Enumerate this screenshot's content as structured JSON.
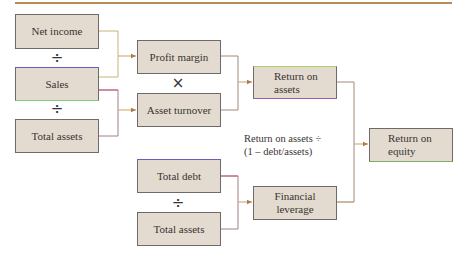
{
  "diagram": {
    "title": "",
    "boxes": {
      "net_income": "Net income",
      "sales": "Sales",
      "total_assets_1": "Total assets",
      "profit_margin": "Profit margin",
      "asset_turnover": "Asset turnover",
      "return_on_assets": "Return on assets",
      "return_on_equity": "Return on equity",
      "total_debt": "Total debt",
      "total_assets_2": "Total assets",
      "financial_leverage": "Financial leverage"
    },
    "operators": {
      "div_1": "÷",
      "div_2": "÷",
      "mult": "×",
      "div_3": "÷"
    },
    "annotation": {
      "line1": "Return on assets ÷",
      "line2": "(1 – debt/assets)"
    },
    "colors": {
      "box_fill": "#e3dbd0",
      "box_border": "#6e6a6a",
      "connector": "#b88a5a",
      "connector_pink": "#c8607a",
      "header_rule": "#b88a5a"
    }
  }
}
